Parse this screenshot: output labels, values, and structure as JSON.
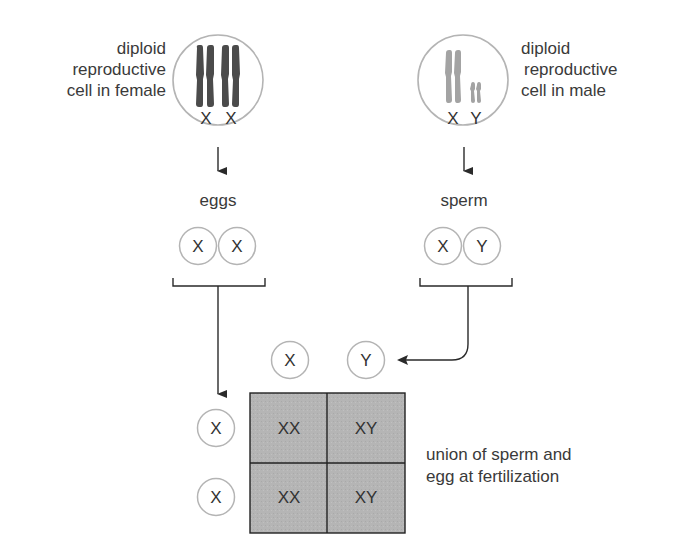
{
  "female": {
    "label_lines": [
      "diploid",
      "reproductive",
      "cell in female"
    ],
    "chromosomes": [
      "X",
      "X"
    ],
    "gamete_label": "eggs",
    "gametes": [
      "X",
      "X"
    ],
    "chromosome_color": "#4b4b4b"
  },
  "male": {
    "label_lines": [
      "diploid",
      "reproductive",
      "cell in male"
    ],
    "chromosomes": [
      "X",
      "Y"
    ],
    "gamete_label": "sperm",
    "gametes": [
      "X",
      "Y"
    ],
    "chromosome_color": "#a3a3a3"
  },
  "punnett": {
    "column_headers": [
      "X",
      "Y"
    ],
    "row_headers": [
      "X",
      "X"
    ],
    "cells": [
      [
        "XX",
        "XY"
      ],
      [
        "XX",
        "XY"
      ]
    ],
    "fill_color": "#b5b5b5",
    "caption_lines": [
      "union of sperm and",
      "egg at fertilization"
    ]
  },
  "colors": {
    "circle_stroke": "#b4b4b4",
    "line": "#2a2a2a",
    "text": "#3a3a3a"
  }
}
